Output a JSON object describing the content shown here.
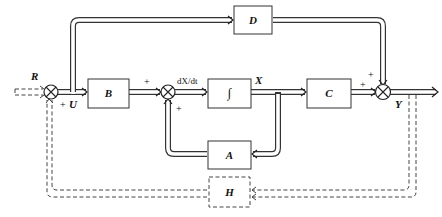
{
  "diagram": {
    "type": "state-space block diagram",
    "blocks": [
      {
        "id": "B",
        "label": "B"
      },
      {
        "id": "integrator",
        "label": "∫"
      },
      {
        "id": "C",
        "label": "C"
      },
      {
        "id": "D",
        "label": "D"
      },
      {
        "id": "A",
        "label": "A"
      },
      {
        "id": "H",
        "label": "H",
        "style": "dashed"
      }
    ],
    "signals": {
      "input": "R",
      "control": "U",
      "derivative": "dX/dt",
      "state": "X",
      "output": "Y"
    },
    "signs": {
      "sum1_bottom": "+",
      "sum2_left": "+",
      "sum2_bottom": "+",
      "sum3_top": "+",
      "sum3_left": "+"
    },
    "connections": [
      {
        "from": "R",
        "to": "sum1",
        "style": "dashed"
      },
      {
        "from": "sum1",
        "to": "B",
        "signal": "U"
      },
      {
        "from": "sum1",
        "to": "D"
      },
      {
        "from": "B",
        "to": "sum2"
      },
      {
        "from": "sum2",
        "to": "integrator",
        "signal": "dX/dt"
      },
      {
        "from": "integrator",
        "to": "C",
        "signal": "X"
      },
      {
        "from": "integrator",
        "to": "A"
      },
      {
        "from": "A",
        "to": "sum2"
      },
      {
        "from": "C",
        "to": "sum3"
      },
      {
        "from": "D",
        "to": "sum3"
      },
      {
        "from": "sum3",
        "to": "Y"
      },
      {
        "from": "Y",
        "to": "H",
        "style": "dashed"
      },
      {
        "from": "H",
        "to": "sum1",
        "style": "dashed"
      }
    ]
  }
}
